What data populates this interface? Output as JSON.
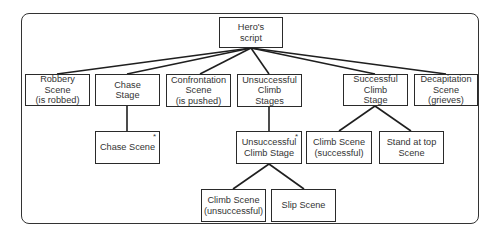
{
  "diagram": {
    "type": "tree",
    "root": {
      "id": "heros-script",
      "label": "Hero's\nscript"
    },
    "nodes": [
      {
        "id": "heros-script",
        "label": "Hero's\nscript",
        "x": 219,
        "y": 17,
        "w": 64,
        "h": 31,
        "starred": false
      },
      {
        "id": "robbery-scene",
        "label": "Robbery Scene\n(is robbed)",
        "x": 25,
        "y": 74,
        "w": 65,
        "h": 32,
        "starred": false
      },
      {
        "id": "chase-stage",
        "label": "Chase\nStage",
        "x": 95,
        "y": 74,
        "w": 65,
        "h": 32,
        "starred": false
      },
      {
        "id": "confrontation-scene",
        "label": "Confrontation\nScene\n(is pushed)",
        "x": 166,
        "y": 74,
        "w": 65,
        "h": 33,
        "starred": false
      },
      {
        "id": "unsuccessful-climb-stages",
        "label": "Unsuccessful\nClimb\nStages",
        "x": 237,
        "y": 74,
        "w": 65,
        "h": 33,
        "starred": false
      },
      {
        "id": "successful-climb-stage",
        "label": "Successful\nClimb\nStage",
        "x": 343,
        "y": 74,
        "w": 65,
        "h": 32,
        "starred": false
      },
      {
        "id": "decapitation-scene",
        "label": "Decapitation\nScene\n(grieves)",
        "x": 414,
        "y": 74,
        "w": 64,
        "h": 32,
        "starred": false
      },
      {
        "id": "chase-scene",
        "label": "Chase Scene",
        "x": 95,
        "y": 131,
        "w": 65,
        "h": 33,
        "starred": true
      },
      {
        "id": "unsuccessful-climb-stage",
        "label": "Unsuccessful\nClimb Stage",
        "x": 236,
        "y": 131,
        "w": 66,
        "h": 33,
        "starred": true
      },
      {
        "id": "climb-scene-successful",
        "label": "Climb Scene\n(successful)",
        "x": 306,
        "y": 131,
        "w": 66,
        "h": 33,
        "starred": false
      },
      {
        "id": "stand-at-top-scene",
        "label": "Stand at top\nScene",
        "x": 379,
        "y": 131,
        "w": 65,
        "h": 33,
        "starred": false
      },
      {
        "id": "climb-scene-unsuccessful",
        "label": "Climb Scene\n(unsuccessful)",
        "x": 201,
        "y": 189,
        "w": 65,
        "h": 33,
        "starred": false
      },
      {
        "id": "slip-scene",
        "label": "Slip Scene",
        "x": 271,
        "y": 189,
        "w": 65,
        "h": 33,
        "starred": false
      }
    ],
    "edges": [
      {
        "from": "heros-script",
        "to": "robbery-scene",
        "x1": 251,
        "y1": 48,
        "x2": 57,
        "y2": 74
      },
      {
        "from": "heros-script",
        "to": "chase-stage",
        "x1": 251,
        "y1": 48,
        "x2": 127,
        "y2": 74
      },
      {
        "from": "heros-script",
        "to": "confrontation-scene",
        "x1": 251,
        "y1": 48,
        "x2": 200,
        "y2": 74
      },
      {
        "from": "heros-script",
        "to": "unsuccessful-climb-stages",
        "x1": 251,
        "y1": 48,
        "x2": 269,
        "y2": 74
      },
      {
        "from": "heros-script",
        "to": "successful-climb-stage",
        "x1": 251,
        "y1": 48,
        "x2": 375,
        "y2": 74
      },
      {
        "from": "heros-script",
        "to": "decapitation-scene",
        "x1": 251,
        "y1": 48,
        "x2": 446,
        "y2": 74
      },
      {
        "from": "chase-stage",
        "to": "chase-scene",
        "x1": 127,
        "y1": 106,
        "x2": 127,
        "y2": 131
      },
      {
        "from": "unsuccessful-climb-stages",
        "to": "unsuccessful-climb-stage",
        "x1": 269,
        "y1": 107,
        "x2": 269,
        "y2": 131
      },
      {
        "from": "successful-climb-stage",
        "to": "climb-scene-successful",
        "x1": 375,
        "y1": 106,
        "x2": 339,
        "y2": 131
      },
      {
        "from": "successful-climb-stage",
        "to": "stand-at-top-scene",
        "x1": 375,
        "y1": 106,
        "x2": 411,
        "y2": 131
      },
      {
        "from": "unsuccessful-climb-stage",
        "to": "climb-scene-unsuccessful",
        "x1": 269,
        "y1": 164,
        "x2": 233,
        "y2": 189
      },
      {
        "from": "unsuccessful-climb-stage",
        "to": "slip-scene",
        "x1": 269,
        "y1": 164,
        "x2": 304,
        "y2": 189
      }
    ],
    "star_marker": "*",
    "colors": {
      "line": "#1f1f1f",
      "box_border": "#2a2a2a",
      "text": "#333333",
      "background": "#ffffff"
    }
  }
}
